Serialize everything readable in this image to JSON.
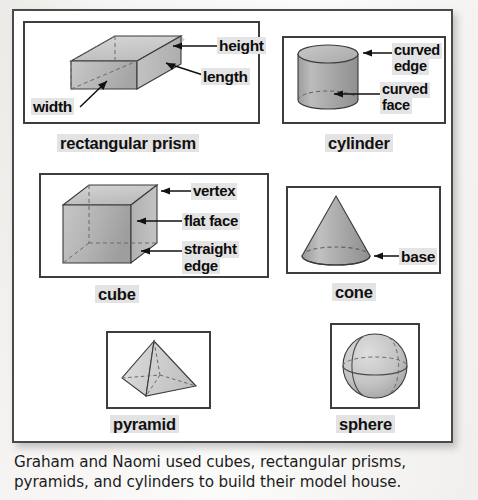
{
  "page": {
    "body_text_line1": "Graham and Naomi used cubes, rectangular prisms,",
    "body_text_line2": "pyramids, and cylinders to build their model house."
  },
  "figures": [
    {
      "id": "rectangular-prism",
      "caption": "rectangular prism",
      "shape": "rectangular-prism",
      "annotations": [
        "height",
        "length",
        "width"
      ]
    },
    {
      "id": "cylinder",
      "caption": "cylinder",
      "shape": "cylinder",
      "annotations": [
        "curved edge",
        "curved face"
      ]
    },
    {
      "id": "cube",
      "caption": "cube",
      "shape": "cube",
      "annotations": [
        "vertex",
        "flat face",
        "straight edge"
      ]
    },
    {
      "id": "cone",
      "caption": "cone",
      "shape": "cone",
      "annotations": [
        "base"
      ]
    },
    {
      "id": "pyramid",
      "caption": "pyramid",
      "shape": "pyramid",
      "annotations": []
    },
    {
      "id": "sphere",
      "caption": "sphere",
      "shape": "sphere",
      "annotations": []
    }
  ],
  "labels": {
    "height": "height",
    "length": "length",
    "width": "width",
    "curved_edge_l1": "curved",
    "curved_edge_l2": "edge",
    "curved_face_l1": "curved",
    "curved_face_l2": "face",
    "vertex": "vertex",
    "flat_face": "flat face",
    "straight_edge_l1": "straight",
    "straight_edge_l2": "edge",
    "base": "base"
  },
  "captions": {
    "rectangular_prism": "rectangular prism",
    "cylinder": "cylinder",
    "cube": "cube",
    "cone": "cone",
    "pyramid": "pyramid",
    "sphere": "sphere"
  },
  "colors": {
    "panel_border": "#4a4a4a",
    "box_border": "#3d3d3d",
    "shape_fill_light": "#d8d8d8",
    "shape_fill_mid": "#b4b4b4",
    "shape_fill_dark": "#8f8f8f",
    "label_highlight": "#e3e3e3",
    "text": "#111111",
    "page_background": "#f2f1ef"
  }
}
